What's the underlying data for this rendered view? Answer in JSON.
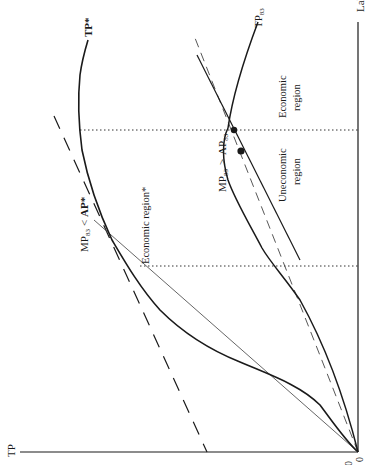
{
  "figure": {
    "orientation": "rotated-90-ccw",
    "axes": {
      "y_label": "TP",
      "x_label": "Lab",
      "origin_x_tick": "0",
      "origin_y_tick": "0"
    },
    "curves": {
      "tp_star": {
        "label": "TP*"
      },
      "tp_83": {
        "label": "TP83",
        "base": "TP",
        "sub": "83"
      }
    },
    "annotations": {
      "mp_lt_ap": {
        "text_mp": "MP",
        "sub1": "83",
        "op": "<",
        "text_ap": "AP*"
      },
      "mp_gt_ap": {
        "text_mp": "MP",
        "sub1": "83",
        "op": ">",
        "text_ap": "AP",
        "sub2": "83"
      },
      "economic_region_star": "Economic region*",
      "economic_region_line1": "Economic",
      "economic_region_line2": "region",
      "uneconomic_region_line1": "Uneconomic",
      "uneconomic_region_line2": "region"
    },
    "colors": {
      "ink": "#1a1a1a",
      "thin": "#555555",
      "background": "#ffffff"
    }
  }
}
